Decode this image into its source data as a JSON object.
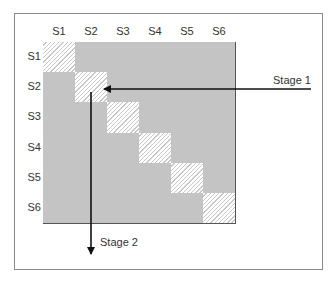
{
  "diagram": {
    "column_labels": [
      "S1",
      "S2",
      "S3",
      "S4",
      "S5",
      "S6"
    ],
    "row_labels": [
      "S1",
      "S2",
      "S3",
      "S4",
      "S5",
      "S6"
    ],
    "diagonal_pattern": "hatched",
    "offdiagonal_fill": "#c4c4c4",
    "arrows": [
      {
        "label": "Stage 1",
        "direction": "left",
        "target": "S2,S2"
      },
      {
        "label": "Stage 2",
        "direction": "down",
        "origin": "S2,S2"
      }
    ]
  },
  "labels": {
    "stage1": "Stage 1",
    "stage2": "Stage 2"
  }
}
